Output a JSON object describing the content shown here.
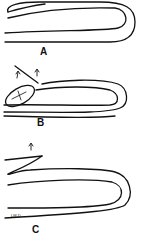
{
  "figure": {
    "panels": [
      {
        "label": "A",
        "description": "folded layer with tip at upper left"
      },
      {
        "label": "B",
        "description": "folded layer with oval pocket at left and two small arrows"
      },
      {
        "label": "C",
        "description": "folded layer with thin flap at upper left and a small arrow"
      }
    ],
    "signature": "LM.D."
  },
  "colors": {
    "stroke": "#111111",
    "background": "#ffffff"
  }
}
